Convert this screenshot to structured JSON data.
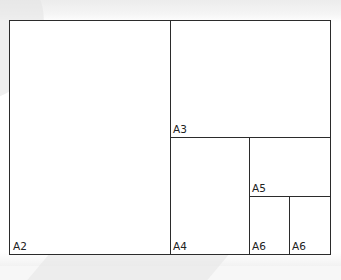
{
  "diagram": {
    "title": "",
    "colors": {
      "line": "#2b2b2b",
      "fill": "#ffffff",
      "text": "#222222"
    },
    "sheets": [
      {
        "id": "a2",
        "label": "A2"
      },
      {
        "id": "a3",
        "label": "A3"
      },
      {
        "id": "a4",
        "label": "A4"
      },
      {
        "id": "a5",
        "label": "A5"
      },
      {
        "id": "a6a",
        "label": "A6"
      },
      {
        "id": "a6b",
        "label": "A6"
      }
    ]
  }
}
